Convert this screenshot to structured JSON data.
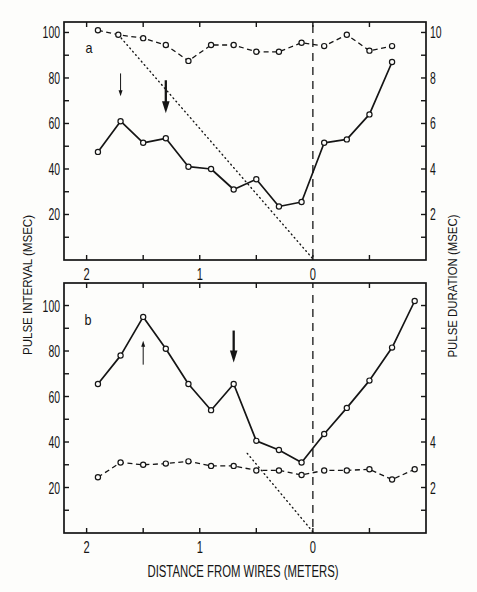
{
  "figure": {
    "x_axis_title": "DISTANCE FROM WIRES (METERS)",
    "left_axis_title": "PULSE INTERVAL (MSEC)",
    "right_axis_title": "PULSE DURATION (MSEC)",
    "ink_color": "#151515",
    "background_color": "#fdfdfb"
  },
  "chart_data": [
    {
      "type": "line",
      "panel": "a",
      "title": "",
      "xlabel": "DISTANCE FROM WIRES (METERS)",
      "ylabel": "PULSE INTERVAL (MSEC)",
      "ylabel_right": "PULSE DURATION (MSEC)",
      "xlim": [
        2.2,
        -1.0
      ],
      "ylim": [
        0,
        104.6
      ],
      "ylim_right": [
        0,
        10.46
      ],
      "grid": false,
      "legend": "none",
      "x_ticks": [
        2,
        1.5,
        1,
        0.5,
        0,
        -0.5
      ],
      "x_tick_labels": [
        {
          "value": 2,
          "label": "2"
        },
        {
          "value": 1,
          "label": "1"
        },
        {
          "value": 0,
          "label": "0"
        }
      ],
      "y_ticks": [
        10,
        20,
        30,
        40,
        50,
        60,
        70,
        80,
        90,
        100
      ],
      "y_tick_labels": [
        {
          "value": 20,
          "label": "20"
        },
        {
          "value": 40,
          "label": "40"
        },
        {
          "value": 60,
          "label": "60"
        },
        {
          "value": 80,
          "label": "80"
        },
        {
          "value": 100,
          "label": "100"
        }
      ],
      "y_right_ticks": [
        1,
        2,
        3,
        4,
        5,
        6,
        7,
        8,
        9,
        10
      ],
      "y_right_tick_labels": [
        {
          "value": 2,
          "label": "2"
        },
        {
          "value": 4,
          "label": "4"
        },
        {
          "value": 6,
          "label": "6"
        },
        {
          "value": 8,
          "label": "8"
        },
        {
          "value": 10,
          "label": "10"
        }
      ],
      "series": [
        {
          "name": "Pulse interval",
          "axis": "left",
          "style": "solid",
          "marker": "open-circle",
          "x": [
            1.9,
            1.7,
            1.5,
            1.3,
            1.1,
            0.9,
            0.7,
            0.5,
            0.3,
            0.1,
            -0.1,
            -0.3,
            -0.5,
            -0.7
          ],
          "y": [
            47.5,
            61,
            51.5,
            53.5,
            41,
            40,
            31,
            35.5,
            23.5,
            25.5,
            51.5,
            53,
            64,
            87
          ]
        },
        {
          "name": "Pulse duration",
          "axis": "right",
          "style": "dashed",
          "marker": "open-circle",
          "x": [
            1.9,
            1.72,
            1.5,
            1.3,
            1.1,
            0.9,
            0.7,
            0.5,
            0.3,
            0.1,
            -0.1,
            -0.3,
            -0.5,
            -0.7
          ],
          "y": [
            10.1,
            9.9,
            9.75,
            9.45,
            8.75,
            9.45,
            9.45,
            9.15,
            9.15,
            9.55,
            9.4,
            9.9,
            9.2,
            9.4
          ]
        }
      ],
      "annotations": {
        "panel_letter": "a",
        "vertical_line": {
          "x": 0,
          "style": "dashed"
        },
        "dotted_line": {
          "from": [
            1.72,
            99
          ],
          "to": [
            0,
            0.5
          ]
        },
        "arrows": [
          {
            "x": 1.7,
            "from": 82,
            "to": 72,
            "weight": "thin",
            "direction": "down"
          },
          {
            "x": 1.3,
            "from": 79,
            "to": 64.5,
            "weight": "thick",
            "direction": "down"
          }
        ]
      }
    },
    {
      "type": "line",
      "panel": "b",
      "title": "",
      "xlabel": "DISTANCE FROM WIRES (METERS)",
      "ylabel": "PULSE INTERVAL (MSEC)",
      "ylabel_right": "PULSE DURATION (MSEC)",
      "xlim": [
        2.2,
        -1.0
      ],
      "ylim": [
        0,
        109.9
      ],
      "ylim_right": [
        0,
        10.99
      ],
      "grid": false,
      "legend": "none",
      "x_ticks": [
        2,
        1.5,
        1,
        0.5,
        0,
        -0.5
      ],
      "x_tick_labels": [
        {
          "value": 2,
          "label": "2"
        },
        {
          "value": 1,
          "label": "1"
        },
        {
          "value": 0,
          "label": "0"
        }
      ],
      "y_ticks": [
        10,
        20,
        30,
        40,
        50,
        60,
        70,
        80,
        90,
        100
      ],
      "y_tick_labels": [
        {
          "value": 20,
          "label": "20"
        },
        {
          "value": 40,
          "label": "40"
        },
        {
          "value": 60,
          "label": "60"
        },
        {
          "value": 80,
          "label": "80"
        },
        {
          "value": 100,
          "label": "100"
        }
      ],
      "y_right_ticks": [
        1,
        2,
        3,
        4,
        5,
        6,
        7,
        8,
        9,
        10
      ],
      "y_right_tick_labels": [
        {
          "value": 2,
          "label": "2"
        },
        {
          "value": 4,
          "label": "4"
        }
      ],
      "series": [
        {
          "name": "Pulse interval",
          "axis": "left",
          "style": "solid",
          "marker": "open-circle",
          "x": [
            1.9,
            1.7,
            1.5,
            1.3,
            1.1,
            0.9,
            0.7,
            0.5,
            0.3,
            0.1,
            -0.1,
            -0.3,
            -0.5,
            -0.7,
            -0.9
          ],
          "y": [
            65.5,
            78,
            95,
            81,
            65.5,
            54,
            65.5,
            40.5,
            36.5,
            31,
            43.5,
            55,
            67,
            81.5,
            102
          ]
        },
        {
          "name": "Pulse duration",
          "axis": "right",
          "style": "dashed",
          "marker": "open-circle",
          "x": [
            1.9,
            1.7,
            1.5,
            1.3,
            1.1,
            0.9,
            0.7,
            0.5,
            0.3,
            0.1,
            -0.1,
            -0.3,
            -0.5,
            -0.7,
            -0.9
          ],
          "y": [
            2.45,
            3.1,
            3.0,
            3.05,
            3.15,
            2.95,
            2.95,
            2.75,
            2.75,
            2.55,
            2.75,
            2.75,
            2.8,
            2.35,
            2.8
          ]
        }
      ],
      "annotations": {
        "panel_letter": "b",
        "vertical_line": {
          "x": 0,
          "style": "dashed"
        },
        "dotted_line": {
          "from": [
            0.58,
            35
          ],
          "to": [
            0,
            0.5
          ]
        },
        "arrows": [
          {
            "x": 1.5,
            "from": 74,
            "to": 84.5,
            "weight": "thin",
            "direction": "up"
          },
          {
            "x": 0.7,
            "from": 89,
            "to": 75,
            "weight": "thick",
            "direction": "down"
          }
        ]
      }
    }
  ]
}
